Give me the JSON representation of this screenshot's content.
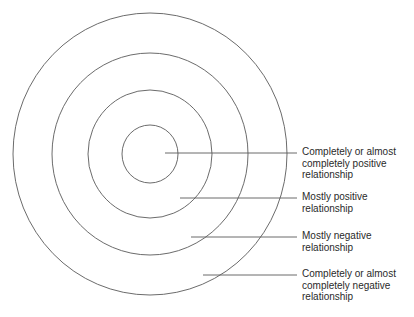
{
  "diagram": {
    "type": "concentric-circles",
    "stroke_color": "#5a5a5a",
    "text_color": "#2a2a2a",
    "center": {
      "x": 150,
      "y": 154
    },
    "rings": [
      {
        "name": "inner",
        "rx": 28,
        "ry": 29
      },
      {
        "name": "second",
        "rx": 62,
        "ry": 64
      },
      {
        "name": "third",
        "rx": 98,
        "ry": 101
      },
      {
        "name": "outer",
        "rx": 137,
        "ry": 141
      }
    ],
    "labels": [
      {
        "lines": [
          "Completely or almost",
          "completely positive",
          "relationship"
        ],
        "leader": {
          "x1": 165,
          "x2": 297,
          "y": 153
        },
        "top": 146
      },
      {
        "lines": [
          "Mostly positive",
          "relationship"
        ],
        "leader": {
          "x1": 180,
          "x2": 297,
          "y": 198
        },
        "top": 191
      },
      {
        "lines": [
          "Mostly negative",
          "relationship"
        ],
        "leader": {
          "x1": 191,
          "x2": 297,
          "y": 237
        },
        "top": 230
      },
      {
        "lines": [
          "Completely or almost",
          "completely negative",
          "relationship"
        ],
        "leader": {
          "x1": 203,
          "x2": 297,
          "y": 275
        },
        "top": 268
      }
    ]
  }
}
